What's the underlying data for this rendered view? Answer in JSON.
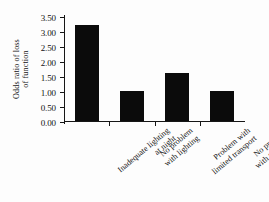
{
  "chart_data": {
    "type": "bar",
    "title": "",
    "xlabel": "",
    "ylabel": "Odds ratio of loss of function",
    "ylabel_lines": [
      "Odds ratio of loss",
      "of function"
    ],
    "categories": [
      "Inadequate lighting at night",
      "No problem with lighting",
      "Problem with limited transport",
      "No problem with transport"
    ],
    "category_lines": [
      [
        "Inadequate lighting",
        "at night"
      ],
      [
        "No problem",
        "with lighting"
      ],
      [
        "Problem with",
        "limited transport"
      ],
      [
        "No problem",
        "with transport"
      ]
    ],
    "values": [
      3.2,
      1.0,
      1.6,
      1.0
    ],
    "ylim": [
      0.0,
      3.5
    ],
    "ytick_values": [
      0.0,
      0.5,
      1.0,
      1.5,
      2.0,
      2.5,
      3.0,
      3.5
    ],
    "ytick_labels": [
      "0.00",
      "0.50",
      "1.00",
      "1.50",
      "2.00",
      "2.50",
      "3.00",
      "3.50"
    ],
    "grid": false,
    "legend": false,
    "bar_color": "#0b0b0b",
    "axis_color": "#161616",
    "background_color": "#fdfdfd"
  }
}
